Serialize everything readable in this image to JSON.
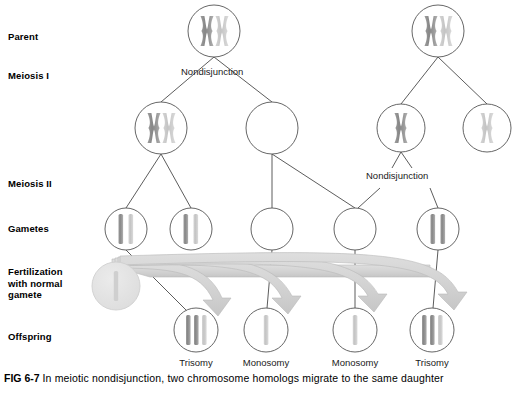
{
  "figure": {
    "number": "FIG 6-7",
    "caption_text": "In meiotic nondisjunction, two chromosome homologs migrate to the same daughter",
    "colors": {
      "chromosome_dark": "#8c8c8c",
      "chromosome_light": "#c9c9c9",
      "circle_stroke": "#555555",
      "line_stroke": "#4a4a4a",
      "arrow_fill": "#d5d5d5",
      "arrow_stroke": "#b3b3b3",
      "fertilization_cell_fill": "#e4e4e4",
      "text": "#000000"
    }
  },
  "row_labels": [
    {
      "id": "parent",
      "text": "Parent",
      "x": 8,
      "y": 31
    },
    {
      "id": "meiosis-i",
      "text": "Meiosis I",
      "x": 8,
      "y": 70
    },
    {
      "id": "meiosis-ii",
      "text": "Meiosis II",
      "x": 8,
      "y": 178
    },
    {
      "id": "gametes",
      "text": "Gametes",
      "x": 8,
      "y": 223
    },
    {
      "id": "fertilization",
      "text": "Fertilization\nwith normal\ngamete",
      "x": 8,
      "y": 268
    },
    {
      "id": "offspring",
      "text": "Offspring",
      "x": 8,
      "y": 331
    }
  ],
  "stage_annotations": [
    {
      "id": "nondisjunction-meiosis-i",
      "text": "Nondisjunction",
      "x": 181,
      "y": 67
    },
    {
      "id": "nondisjunction-meiosis-ii",
      "text": "Nondisjunction",
      "x": 366,
      "y": 171
    }
  ],
  "outcome_labels": [
    {
      "id": "outcome-1",
      "text": "Trisomy",
      "center_x": 196,
      "y": 359
    },
    {
      "id": "outcome-2",
      "text": "Monosomy",
      "center_x": 266,
      "y": 359
    },
    {
      "id": "outcome-3",
      "text": "Monosomy",
      "center_x": 355,
      "y": 359
    },
    {
      "id": "outcome-4",
      "text": "Trisomy",
      "center_x": 432,
      "y": 359
    }
  ],
  "cells": {
    "parents": [
      {
        "id": "parent-left",
        "cx": 214,
        "cy": 31,
        "r": 26,
        "contents": "XX"
      },
      {
        "id": "parent-right",
        "cx": 438,
        "cy": 31,
        "r": 26,
        "contents": "XX"
      }
    ],
    "meiosis_i": [
      {
        "id": "meiosis-i-left-a",
        "cx": 161,
        "cy": 128,
        "r": 26,
        "contents": "XX"
      },
      {
        "id": "meiosis-i-left-b",
        "cx": 272,
        "cy": 128,
        "r": 26,
        "contents": "empty"
      },
      {
        "id": "meiosis-i-right-a",
        "cx": 401,
        "cy": 128,
        "r": 24,
        "contents": "X-dark"
      },
      {
        "id": "meiosis-i-right-b",
        "cx": 487,
        "cy": 128,
        "r": 24,
        "contents": "X-light"
      }
    ],
    "gametes": [
      {
        "id": "gamete-1",
        "cx": 126,
        "cy": 229,
        "r": 21,
        "contents": "two-bars"
      },
      {
        "id": "gamete-2",
        "cx": 191,
        "cy": 229,
        "r": 21,
        "contents": "two-bars"
      },
      {
        "id": "gamete-3",
        "cx": 272,
        "cy": 229,
        "r": 21,
        "contents": "empty"
      },
      {
        "id": "gamete-4",
        "cx": 355,
        "cy": 229,
        "r": 21,
        "contents": "empty"
      },
      {
        "id": "gamete-5",
        "cx": 438,
        "cy": 229,
        "r": 21,
        "contents": "two-bars-dark"
      }
    ],
    "fertilization_gamete": {
      "id": "normal-gamete",
      "cx": 116,
      "cy": 286,
      "r": 24,
      "contents": "one-bar-light"
    },
    "offspring": [
      {
        "id": "offspring-1",
        "cx": 196,
        "cy": 330,
        "r": 22,
        "contents": "three-bars",
        "outcome": "Trisomy"
      },
      {
        "id": "offspring-2",
        "cx": 266,
        "cy": 330,
        "r": 22,
        "contents": "one-bar",
        "outcome": "Monosomy"
      },
      {
        "id": "offspring-3",
        "cx": 355,
        "cy": 330,
        "r": 22,
        "contents": "one-bar",
        "outcome": "Monosomy"
      },
      {
        "id": "offspring-4",
        "cx": 432,
        "cy": 330,
        "r": 22,
        "contents": "three-bars",
        "outcome": "Trisomy"
      }
    ]
  }
}
